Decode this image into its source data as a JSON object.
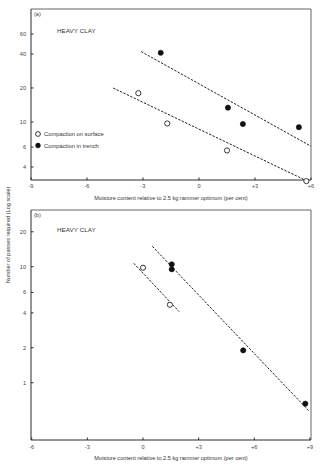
{
  "figure": {
    "y_axis_label": "Number of passes required (Log scale)"
  },
  "legend": {
    "items": [
      {
        "label": "Compaction on surface",
        "marker": "hollow-circle"
      },
      {
        "label": "Compaction in trench",
        "marker": "filled-circle"
      }
    ]
  },
  "panels": [
    {
      "tag": "(a)",
      "soil": "HEAVY CLAY",
      "xlabel": "Moisture content relative to 2.5 kg rammer optimum (per cent)",
      "x_ticks": [
        "-9",
        "-6",
        "-3",
        "0",
        "+3",
        "+6"
      ],
      "y_ticks": [
        "60",
        "40",
        "20",
        "10",
        "6",
        "4"
      ]
    },
    {
      "tag": "(b)",
      "soil": "HEAVY CLAY",
      "xlabel": "Moisture content relative to 2.5 kg rammer optimum (per cent)",
      "x_ticks": [
        "-6",
        "-3",
        "0",
        "+3",
        "+6",
        "+9"
      ],
      "y_ticks": [
        "20",
        "10",
        "6",
        "4",
        "2",
        "1"
      ]
    }
  ],
  "chart_data": [
    {
      "type": "scatter",
      "title": "(a) HEAVY CLAY",
      "xlabel": "Moisture content relative to 2.5 kg rammer optimum (per cent)",
      "ylabel": "Number of passes required (Log scale)",
      "xlim": [
        -9,
        6
      ],
      "ylim": [
        3,
        80
      ],
      "yscale": "log",
      "x_ticks": [
        -9,
        -6,
        -3,
        0,
        3,
        6
      ],
      "y_ticks": [
        4,
        6,
        10,
        20,
        40,
        60
      ],
      "grid": false,
      "legend_position": "lower-left",
      "series": [
        {
          "name": "Compaction on surface",
          "marker": "hollow-circle",
          "points": [
            [
              -3.25,
              18
            ],
            [
              -1.7,
              9.7
            ],
            [
              1.5,
              5.6
            ],
            [
              5.75,
              3.0
            ]
          ],
          "fit_line": [
            [
              -4.6,
              20
            ],
            [
              5.8,
              3.0
            ]
          ]
        },
        {
          "name": "Compaction in trench",
          "marker": "filled-circle",
          "points": [
            [
              -2.05,
              41
            ],
            [
              1.55,
              13.4
            ],
            [
              2.35,
              9.6
            ],
            [
              5.35,
              9.0
            ]
          ],
          "fit_line": [
            [
              -3.1,
              42
            ],
            [
              6.0,
              6.1
            ]
          ]
        }
      ]
    },
    {
      "type": "scatter",
      "title": "(b) HEAVY CLAY",
      "xlabel": "Moisture content relative to 2.5 kg rammer optimum (per cent)",
      "ylabel": "Number of passes required (Log scale)",
      "xlim": [
        -6,
        9
      ],
      "ylim": [
        0.35,
        35
      ],
      "yscale": "log",
      "x_ticks": [
        -6,
        -3,
        0,
        3,
        6,
        9
      ],
      "y_ticks": [
        1,
        2,
        4,
        6,
        10,
        20
      ],
      "grid": false,
      "series": [
        {
          "name": "Compaction on surface",
          "marker": "hollow-circle",
          "points": [
            [
              0.0,
              9.8
            ],
            [
              1.45,
              4.7
            ]
          ],
          "fit_line": [
            [
              -0.5,
              10.7
            ],
            [
              1.95,
              4.1
            ]
          ]
        },
        {
          "name": "Compaction in trench",
          "marker": "filled-circle",
          "points": [
            [
              1.55,
              10.5
            ],
            [
              1.55,
              9.5
            ],
            [
              5.4,
              1.9
            ],
            [
              8.75,
              0.66
            ]
          ],
          "fit_line": [
            [
              0.5,
              15
            ],
            [
              8.95,
              0.57
            ]
          ]
        }
      ]
    }
  ]
}
